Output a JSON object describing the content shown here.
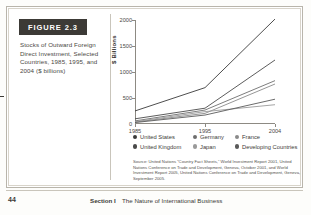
{
  "figure": {
    "tag_label": "FIGURE 2.3",
    "caption": "Stocks of Outward Foreign Direct Investment, Selected Countries, 1985, 1995, and 2004 ($ billions)"
  },
  "chart_data": {
    "type": "line",
    "title": "",
    "xlabel": "",
    "ylabel": "$ Billions",
    "x": [
      "1985",
      "1995",
      "2004"
    ],
    "xtick_labels": [
      "1985",
      "1995",
      "2004"
    ],
    "ytick_labels": [
      "0",
      "500",
      "1000",
      "1500",
      "2000"
    ],
    "ytick_values": [
      0,
      500,
      1000,
      1500,
      2000
    ],
    "ylim": [
      0,
      2000
    ],
    "grid": false,
    "legend_position": "bottom",
    "series": [
      {
        "name": "United States",
        "values": [
          251,
          699,
          2018
        ],
        "color": "#3a3a3a"
      },
      {
        "name": "United Kingdom",
        "values": [
          100,
          304,
          1231
        ],
        "color": "#4a4a4a"
      },
      {
        "name": "Germany",
        "values": [
          60,
          268,
          834
        ],
        "color": "#6e6e6e"
      },
      {
        "name": "France",
        "values": [
          37,
          204,
          769
        ],
        "color": "#8a8a8a"
      },
      {
        "name": "Japan",
        "values": [
          44,
          238,
          371
        ],
        "color": "#9a9a9a"
      },
      {
        "name": "Developing Countries",
        "values": [
          28,
          172,
          477
        ],
        "color": "#5a5a5a"
      }
    ]
  },
  "legend": {
    "rows": [
      [
        {
          "label": "United States",
          "color": "#3a3a3a"
        },
        {
          "label": "Germany",
          "color": "#6e6e6e"
        },
        {
          "label": "France",
          "color": "#8a8a8a"
        }
      ],
      [
        {
          "label": "United Kingdom",
          "color": "#4a4a4a"
        },
        {
          "label": "Japan",
          "color": "#9a9a9a"
        },
        {
          "label": "Developing Countries",
          "color": "#5a5a5a"
        }
      ]
    ]
  },
  "source": {
    "text": "Source: United Nations “Country Fact Sheets,” World Investment Report 2001, United Nations Conference on Trade and Development, Geneva, October 2001, and World Investment Report 2005, United Nations Conference on Trade and Development, Geneva, September 2005."
  },
  "footer": {
    "page_number": "44",
    "section": "Section I",
    "title": "The Nature of International Business"
  }
}
